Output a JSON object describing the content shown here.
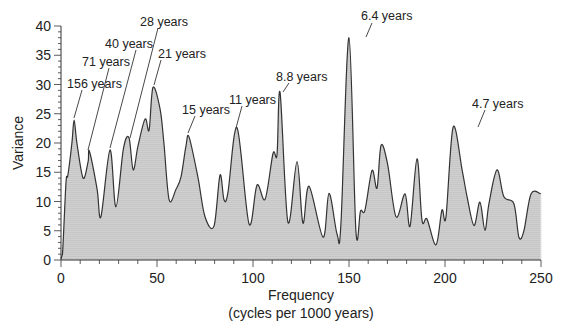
{
  "chart_data": {
    "type": "area",
    "title": "",
    "xlabel": "Frequency",
    "xlabel_sub": "(cycles per 1000 years)",
    "ylabel": "Variance",
    "xlim": [
      0,
      250
    ],
    "ylim": [
      0,
      40
    ],
    "x_ticks": [
      0,
      50,
      100,
      150,
      200,
      250
    ],
    "y_ticks": [
      0,
      5,
      10,
      15,
      20,
      25,
      30,
      35,
      40
    ],
    "grid": false,
    "legend": null,
    "fill_color": "#cfcfcf",
    "line_color": "#333333",
    "series": [
      {
        "name": "Variance spectrum",
        "x": [
          0,
          0.5,
          1,
          2.6,
          3.6,
          5.7,
          6.8,
          8.3,
          11.5,
          14.1,
          14.8,
          18.8,
          20.8,
          25.5,
          28.6,
          32.5,
          35.4,
          37.6,
          40.1,
          43.8,
          45.9,
          47.9,
          51.6,
          53.6,
          56.3,
          59.9,
          62.5,
          65.1,
          66.7,
          71.4,
          75.0,
          79.7,
          82.8,
          84.9,
          87.0,
          91.7,
          97.9,
          102.1,
          106.3,
          110.4,
          112.5,
          114.1,
          118.2,
          122.9,
          126.0,
          129.2,
          136.5,
          139.6,
          143.8,
          145.8,
          150.0,
          153.6,
          156.0,
          158.3,
          162.0,
          164.6,
          166.7,
          170.1,
          174.5,
          179.2,
          181.8,
          185.4,
          188.0,
          190.6,
          195.3,
          198.4,
          200.5,
          204.2,
          208.9,
          211.5,
          215.1,
          218.2,
          220.8,
          222.9,
          227.1,
          230.7,
          235.9,
          238.5,
          241.1,
          244.8,
          250.0
        ],
        "y": [
          0.2,
          0.8,
          2.2,
          13.3,
          14.5,
          20.0,
          23.9,
          20.0,
          14.0,
          16.8,
          18.6,
          12.1,
          7.4,
          18.8,
          9.1,
          19.0,
          20.9,
          15.4,
          19.5,
          24.1,
          22.2,
          29.5,
          25.8,
          20.0,
          10.3,
          12.1,
          14.2,
          19.5,
          21.0,
          14.0,
          7.4,
          5.8,
          14.5,
          10.3,
          11.6,
          22.6,
          6.2,
          12.8,
          10.4,
          18.2,
          18.0,
          28.6,
          6.5,
          16.8,
          6.3,
          12.6,
          3.9,
          11.4,
          4.4,
          6.1,
          38.0,
          5.0,
          8.4,
          8.5,
          15.3,
          12.3,
          19.6,
          16.4,
          7.4,
          11.3,
          5.8,
          17.3,
          6.8,
          7.0,
          2.6,
          8.5,
          7.4,
          22.7,
          15.4,
          10.8,
          5.9,
          9.9,
          5.1,
          9.7,
          15.4,
          10.8,
          9.6,
          3.9,
          5.0,
          11.3,
          11.3
        ]
      }
    ],
    "annotations": [
      {
        "text": "156 years",
        "x_freq": 6.4,
        "peak_y": 24
      },
      {
        "text": "71 years",
        "x_freq": 14,
        "peak_y": 18.6
      },
      {
        "text": "40 years",
        "x_freq": 25,
        "peak_y": 18.8
      },
      {
        "text": "28 years",
        "x_freq": 35.4,
        "peak_y": 20.9
      },
      {
        "text": "21 years",
        "x_freq": 48,
        "peak_y": 29.5
      },
      {
        "text": "15 years",
        "x_freq": 66,
        "peak_y": 21
      },
      {
        "text": "11 years",
        "x_freq": 91.7,
        "peak_y": 22.6
      },
      {
        "text": "8.8 years",
        "x_freq": 114,
        "peak_y": 28.6
      },
      {
        "text": "6.4 years",
        "x_freq": 158,
        "peak_y": 38
      },
      {
        "text": "4.7 years",
        "x_freq": 215,
        "peak_y": 22.7
      }
    ]
  },
  "labels": {
    "ylabel": "Variance",
    "xlabel": "Frequency",
    "xlabel_sub": "(cycles per 1000 years)"
  },
  "annotation_layout": [
    {
      "text": "156 years",
      "tx": 67,
      "ty": 88,
      "x1": 82,
      "y1": 90,
      "x2": 74,
      "y2": 118
    },
    {
      "text": "71 years",
      "tx": 82,
      "ty": 66,
      "x1": 109,
      "y1": 68,
      "x2": 88,
      "y2": 150
    },
    {
      "text": "40 years",
      "tx": 105,
      "ty": 48,
      "x1": 136,
      "y1": 50,
      "x2": 110,
      "y2": 148
    },
    {
      "text": "28 years",
      "tx": 140,
      "ty": 26,
      "x1": 158,
      "y1": 28,
      "x2": 130,
      "y2": 138
    },
    {
      "text": "21 years",
      "tx": 158,
      "ty": 58,
      "x1": 161,
      "y1": 60,
      "x2": 154,
      "y2": 85
    },
    {
      "text": "15 years",
      "tx": 182,
      "ty": 114,
      "x1": 195,
      "y1": 116,
      "x2": 188,
      "y2": 133
    },
    {
      "text": "11 years",
      "tx": 229,
      "ty": 104,
      "x1": 242,
      "y1": 106,
      "x2": 236,
      "y2": 128
    },
    {
      "text": "8.8 years",
      "tx": 276,
      "ty": 81,
      "x1": 289,
      "y1": 83,
      "x2": 283,
      "y2": 92
    },
    {
      "text": "6.4 years",
      "tx": 361,
      "ty": 20,
      "x1": 372,
      "y1": 23,
      "x2": 366,
      "y2": 37
    },
    {
      "text": "4.7 years",
      "tx": 472,
      "ty": 108,
      "x1": 485,
      "y1": 110,
      "x2": 478,
      "y2": 127
    }
  ]
}
